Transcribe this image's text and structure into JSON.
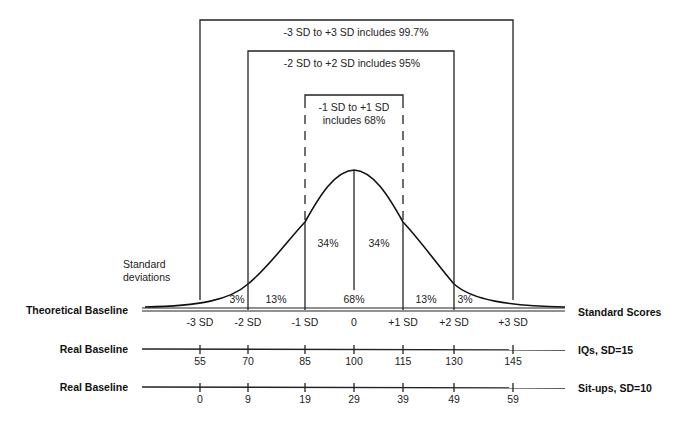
{
  "diagram": {
    "type": "normal-distribution",
    "brackets": {
      "outer": "-3 SD to +3 SD includes 99.7%",
      "middle": "-2 SD to +2 SD includes 95%",
      "inner_line1": "-1 SD to +1 SD",
      "inner_line2": "includes 68%"
    },
    "curve_label_line1": "Standard",
    "curve_label_line2": "deviations",
    "areas": {
      "left_3": "3%",
      "left_13": "13%",
      "left_34": "34%",
      "right_34": "34%",
      "center_68": "68%",
      "right_13": "13%",
      "right_3": "3%"
    },
    "rows": [
      {
        "left_label": "Theoretical Baseline",
        "right_label": "Standard Scores",
        "ticks": [
          "-3 SD",
          "-2 SD",
          "-1 SD",
          "0",
          "+1 SD",
          "+2 SD",
          "+3 SD"
        ]
      },
      {
        "left_label": "Real Baseline",
        "right_label": "IQs, SD=15",
        "ticks": [
          "55",
          "70",
          "85",
          "100",
          "115",
          "130",
          "145"
        ]
      },
      {
        "left_label": "Real Baseline",
        "right_label": "Sit-ups, SD=10",
        "ticks": [
          "0",
          "9",
          "19",
          "29",
          "39",
          "49",
          "59"
        ]
      }
    ]
  }
}
